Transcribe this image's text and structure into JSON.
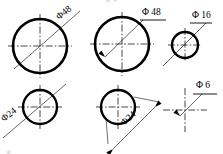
{
  "drawing": {
    "title": "Circle diameter dimensioning examples",
    "sheet_width": 223,
    "sheet_height": 154,
    "line_color": "#000000",
    "centerline_color": "#1a1a1a",
    "leader_color": "#333333",
    "faint_text_color": "#c9c9c9",
    "background": "#ffffff",
    "faint_header": "Ф 4",
    "faint_footer": "Ф"
  },
  "figures": [
    {
      "id": "fig-top-left",
      "name": "circle-phi48-through-leader",
      "label": "Φ48",
      "label_style": "rotated-through-circle",
      "label_rotation_deg": -38,
      "label_x": 59,
      "label_y": 20,
      "circle": {
        "cx": 40,
        "cy": 46,
        "r": 27,
        "stroke_width": 2.6
      },
      "centerline_h": {
        "x1": 8,
        "y1": 46,
        "x2": 72,
        "y2": 46
      },
      "centerline_v": {
        "x1": 40,
        "y1": 14,
        "x2": 40,
        "y2": 78
      },
      "leader": {
        "x1": 14,
        "y1": 69,
        "x2": 80,
        "y2": 11
      },
      "arrow": null,
      "underline": null
    },
    {
      "id": "fig-top-middle",
      "name": "circle-phi48-arrow-leader",
      "label": "Φ 48",
      "label_style": "horizontal-with-shelf",
      "label_rotation_deg": 0,
      "label_x": 142,
      "label_y": 15,
      "circle": {
        "cx": 122,
        "cy": 44,
        "r": 27,
        "stroke_width": 2.6
      },
      "centerline_h": {
        "x1": 90,
        "y1": 44,
        "x2": 154,
        "y2": 44
      },
      "centerline_v": {
        "x1": 122,
        "y1": 12,
        "x2": 122,
        "y2": 76
      },
      "leader": {
        "x1": 105,
        "y1": 57,
        "x2": 143,
        "y2": 20
      },
      "arrow": {
        "x": 105,
        "y": 57,
        "angle_deg": 224
      },
      "underline": {
        "x1": 140,
        "y1": 20,
        "x2": 166,
        "y2": 20
      }
    },
    {
      "id": "fig-top-right",
      "name": "circle-phi16-diagonal-leader",
      "label": "Φ 16",
      "label_style": "horizontal-with-shelf",
      "label_rotation_deg": 0,
      "label_x": 192,
      "label_y": 18,
      "circle": {
        "cx": 185,
        "cy": 45,
        "r": 13,
        "stroke_width": 2.4
      },
      "centerline_h": {
        "x1": 168,
        "y1": 45,
        "x2": 202,
        "y2": 45
      },
      "centerline_v": {
        "x1": 185,
        "y1": 28,
        "x2": 185,
        "y2": 62
      },
      "leader": {
        "x1": 163,
        "y1": 66,
        "x2": 206,
        "y2": 23
      },
      "arrow": null,
      "underline": {
        "x1": 190,
        "y1": 23,
        "x2": 212,
        "y2": 23
      }
    },
    {
      "id": "fig-bottom-left",
      "name": "circle-phi24-through-leader",
      "label": "Φ24",
      "label_style": "rotated-through-circle",
      "label_rotation_deg": -38,
      "label_x": 4,
      "label_y": 122,
      "circle": {
        "cx": 40,
        "cy": 107,
        "r": 17,
        "stroke_width": 2.4
      },
      "centerline_h": {
        "x1": 18,
        "y1": 107,
        "x2": 62,
        "y2": 107
      },
      "centerline_v": {
        "x1": 40,
        "y1": 85,
        "x2": 40,
        "y2": 129
      },
      "leader": {
        "x1": 3,
        "y1": 138,
        "x2": 66,
        "y2": 84
      },
      "arrow": null,
      "underline": null
    },
    {
      "id": "fig-bottom-middle",
      "name": "circle-phi24-external-dimension",
      "label": "Φ24",
      "label_style": "rotated-on-dimension-line",
      "label_rotation_deg": -42,
      "label_x": 124,
      "label_y": 126,
      "circle": {
        "cx": 118,
        "cy": 107,
        "r": 17,
        "stroke_width": 2.4
      },
      "centerline_h": {
        "x1": 96,
        "y1": 107,
        "x2": 140,
        "y2": 107
      },
      "centerline_v": {
        "x1": 118,
        "y1": 85,
        "x2": 118,
        "y2": 129
      },
      "leader": {
        "x1": 113,
        "y1": 149,
        "x2": 155,
        "y2": 107
      },
      "arrow": {
        "x": 113,
        "y": 149,
        "angle_deg": 135
      },
      "arrow2": {
        "x": 155,
        "y": 107,
        "angle_deg": -45
      },
      "ext_line_1": {
        "x1": 106,
        "y1": 118,
        "x2": 108,
        "y2": 144
      },
      "ext_line_2": {
        "x1": 134,
        "y1": 97,
        "x2": 159,
        "y2": 102
      },
      "underline": null
    },
    {
      "id": "fig-bottom-right",
      "name": "crosshair-phi6-leader",
      "label": "Φ 6",
      "label_style": "horizontal-with-shelf",
      "label_rotation_deg": 0,
      "label_x": 196,
      "label_y": 88,
      "circle": null,
      "centerline_h": {
        "x1": 163,
        "y1": 110,
        "x2": 207,
        "y2": 110
      },
      "centerline_v": {
        "x1": 185,
        "y1": 88,
        "x2": 185,
        "y2": 132
      },
      "leader": {
        "x1": 180,
        "y1": 116,
        "x2": 202,
        "y2": 94
      },
      "arrow": {
        "x": 180,
        "y": 116,
        "angle_deg": 225
      },
      "underline": {
        "x1": 193,
        "y1": 94,
        "x2": 217,
        "y2": 94
      }
    }
  ]
}
